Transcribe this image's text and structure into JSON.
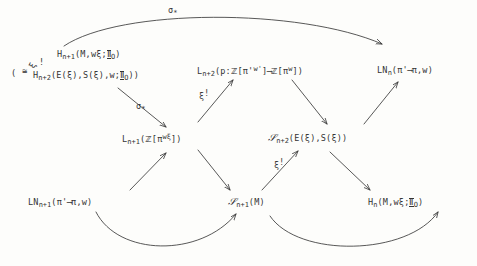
{
  "page": {
    "background_color": "#fdfdfb",
    "ink_color": "#343434",
    "width": 477,
    "height": 266
  },
  "nodes": {
    "top_left": {
      "name": "homology-top-left",
      "main_symbol": "H",
      "main_sub": "n+1",
      "main_args": "(M,wξ;",
      "main_coeff": "Ⅱ",
      "main_coeff_sub": "O",
      "main_close": ")",
      "iso_prefix": "(",
      "iso_symbol": "≅",
      "alt_symbol": "H",
      "alt_sub": "n+2",
      "alt_args": "(E(ξ),S(ξ),w;",
      "alt_coeff": "Ⅱ",
      "alt_coeff_sub": "O",
      "alt_close": "))",
      "xi_shriek": "ξ",
      "shriek": "!",
      "plain_text": "H_{n+1}(M,wξ;Ⅱ_O)  (≅ H_{n+2}(E(ξ),S(ξ),w;Ⅱ_O))"
    },
    "top_mid": {
      "name": "l-group-top-mid",
      "symbol": "L",
      "sub": "n+2",
      "open": "(p:",
      "source_ring": "ℤ",
      "source_bracket_open": "[",
      "source_pi": "π'",
      "source_sup": "w'",
      "source_bracket_close": "]",
      "arrow": "⟶",
      "target_ring": "ℤ",
      "target_bracket_open": "[",
      "target_pi": "π",
      "target_sup": "w",
      "target_bracket_close": "]",
      "close": ")",
      "plain_text": "L_{n+2}(p: ℤ[π'^{w'}] ⟶ ℤ[π^w])"
    },
    "top_right": {
      "name": "ln-group-top-right",
      "symbol": "LN",
      "sub": "n",
      "open": "(",
      "source_pi": "π'",
      "arrow": "⟶",
      "target_pi": "π",
      "orientation": ",w",
      "close": ")",
      "plain_text": "LN_n(π' ⟶ π, w)"
    },
    "mid_left": {
      "name": "l-group-mid-left",
      "symbol": "L",
      "sub": "n+1",
      "open": "(",
      "ring": "ℤ",
      "bracket_open": "[",
      "pi": "π",
      "sup": "wξ",
      "bracket_close": "]",
      "close": ")",
      "plain_text": "L_{n+1}(ℤ[π^{wξ}])"
    },
    "mid_right": {
      "name": "structure-set-mid-right",
      "symbol": "𝒮",
      "sub": "n+2",
      "args": "(E(ξ),S(ξ))",
      "plain_text": "𝒮_{n+2}(E(ξ),S(ξ))"
    },
    "bottom_left": {
      "name": "ln-group-bottom-left",
      "symbol": "LN",
      "sub": "n+1",
      "open": "(",
      "source_pi": "π'",
      "arrow": "⟶",
      "target_pi": "π",
      "orientation": ",w",
      "close": ")",
      "plain_text": "LN_{n+1}(π' ⟶ π, w)"
    },
    "bottom_mid": {
      "name": "structure-set-bottom-mid",
      "symbol": "𝒮",
      "sub": "n+1",
      "args": "(M)",
      "plain_text": "𝒮_{n+1}(M)"
    },
    "bottom_right": {
      "name": "homology-bottom-right",
      "symbol": "H",
      "sub": "n",
      "args": "(M,wξ;",
      "coeff": "Ⅱ",
      "coeff_sub": "O",
      "close": ")",
      "plain_text": "H_n(M,wξ;Ⅱ_O)"
    }
  },
  "arrow_labels": {
    "sigma_top": {
      "name": "sigma-star-top",
      "text": "σ",
      "star": "*"
    },
    "sigma_mid": {
      "name": "sigma-star-mid",
      "text": "σ",
      "star": "*"
    },
    "xi_upper": {
      "name": "xi-shriek-upper",
      "text": "ξ",
      "shriek": "!"
    },
    "xi_lower": {
      "name": "xi-shriek-lower",
      "text": "ξ",
      "shriek": "!"
    }
  },
  "edges": [
    {
      "name": "edge-top-left-to-top-right-curve",
      "from": "top_left",
      "to": "top_right",
      "style": "curved",
      "label": "sigma_top"
    },
    {
      "name": "edge-top-left-to-mid-left",
      "from": "top_left",
      "to": "mid_left",
      "style": "straight",
      "label": "sigma_mid"
    },
    {
      "name": "edge-mid-left-to-top-mid",
      "from": "mid_left",
      "to": "top_mid",
      "style": "straight",
      "label": "xi_upper"
    },
    {
      "name": "edge-top-mid-to-mid-right",
      "from": "top_mid",
      "to": "mid_right",
      "style": "straight",
      "label": null
    },
    {
      "name": "edge-mid-right-to-top-right",
      "from": "mid_right",
      "to": "top_right",
      "style": "straight",
      "label": null
    },
    {
      "name": "edge-bottom-left-to-mid-left",
      "from": "bottom_left",
      "to": "mid_left",
      "style": "straight",
      "label": null
    },
    {
      "name": "edge-mid-left-to-bottom-mid",
      "from": "mid_left",
      "to": "bottom_mid",
      "style": "straight",
      "label": null
    },
    {
      "name": "edge-bottom-mid-to-mid-right",
      "from": "bottom_mid",
      "to": "mid_right",
      "style": "straight",
      "label": "xi_lower"
    },
    {
      "name": "edge-mid-right-to-bottom-right",
      "from": "mid_right",
      "to": "bottom_right",
      "style": "straight",
      "label": null
    },
    {
      "name": "edge-bottom-left-to-bottom-mid-curve",
      "from": "bottom_left",
      "to": "bottom_mid",
      "style": "curved",
      "label": null
    },
    {
      "name": "edge-bottom-mid-to-bottom-right-curve",
      "from": "bottom_mid",
      "to": "bottom_right",
      "style": "curved",
      "label": null
    }
  ]
}
